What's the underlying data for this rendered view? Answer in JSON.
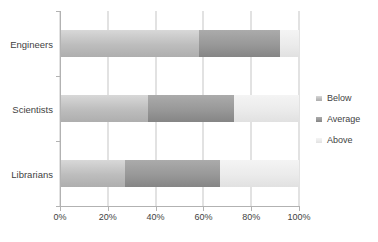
{
  "chart_data": {
    "type": "bar",
    "orientation": "horizontal",
    "stacked": true,
    "percent_stacked": true,
    "categories": [
      "Engineers",
      "Scientists",
      "Librarians"
    ],
    "series": [
      {
        "name": "Below",
        "values": [
          58,
          37,
          27
        ],
        "color": "#bdbdbd",
        "color_top": "#d8d8d8",
        "color_bottom": "#aeaeae"
      },
      {
        "name": "Average",
        "values": [
          34,
          36,
          40
        ],
        "color": "#989898",
        "color_top": "#ababab",
        "color_bottom": "#858585"
      },
      {
        "name": "Above",
        "values": [
          8,
          27,
          33
        ],
        "color": "#ebebeb",
        "color_top": "#f4f4f4",
        "color_bottom": "#e1e1e1"
      }
    ],
    "x_ticks": [
      "0%",
      "20%",
      "40%",
      "60%",
      "80%",
      "100%"
    ],
    "xlim": [
      0,
      100
    ],
    "grid": "vertical",
    "legend_position": "right"
  },
  "colors": {
    "background": "#ffffff",
    "gridline": "#c6c6c6",
    "axis": "#b2b2b2",
    "text": "#3f3f3f"
  }
}
